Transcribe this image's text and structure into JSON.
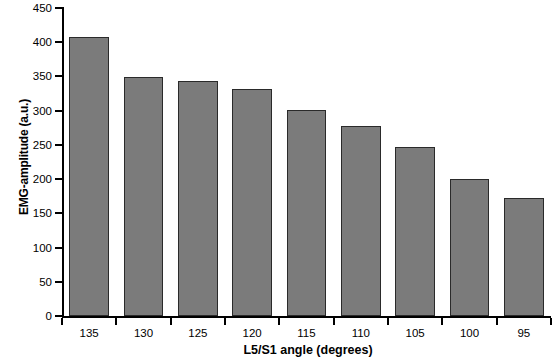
{
  "chart_data": {
    "type": "bar",
    "title": "",
    "xlabel": "L5/S1 angle (degrees)",
    "ylabel": "EMG-amplitude (a.u.)",
    "categories": [
      "135",
      "130",
      "125",
      "120",
      "115",
      "110",
      "105",
      "100",
      "95"
    ],
    "values": [
      408,
      349,
      343,
      332,
      301,
      277,
      247,
      200,
      172
    ],
    "ylim": [
      0,
      450
    ],
    "yticks": [
      0,
      50,
      100,
      150,
      200,
      250,
      300,
      350,
      400,
      450
    ],
    "ytick_labels": [
      "0",
      "50",
      "100",
      "150",
      "200",
      "250",
      "300",
      "350",
      "400",
      "450"
    ],
    "grid": false,
    "legend": null,
    "series": [
      {
        "name": "EMG-amplitude",
        "values": [
          408,
          349,
          343,
          332,
          301,
          277,
          247,
          200,
          172
        ]
      }
    ],
    "bar_fill_color": "#7b7b7b",
    "bar_edge_color": "#2a2a2a",
    "axis_color": "#000000",
    "background_color": "#ffffff"
  }
}
